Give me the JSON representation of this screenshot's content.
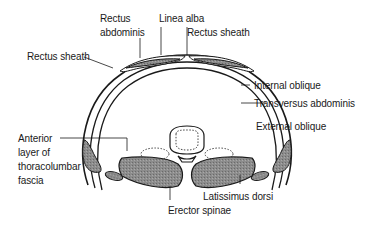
{
  "diagram": {
    "type": "anatomical-cross-section",
    "colors": {
      "line": "#1a1a1a",
      "muscle_fill": "#8a8a8a",
      "rectus_fill": "#9a9a9a",
      "bone_fill": "#ffffff",
      "background": "#ffffff"
    },
    "labels": {
      "rectus_abdominis_1": "Rectus",
      "rectus_abdominis_2": "abdominis",
      "linea_alba": "Linea alba",
      "rectus_sheath_right": "Rectus sheath",
      "rectus_sheath_left": "Rectus sheath",
      "internal_oblique": "Internal oblique",
      "transversus_abdominis": "Transversus abdominis",
      "external_oblique": "External oblique",
      "anterior_layer_1": "Anterior",
      "anterior_layer_2": "layer of",
      "anterior_layer_3": "thoracolumbar",
      "anterior_layer_4": "fascia",
      "latissimus_dorsi": "Latissimus dorsi",
      "erector_spinae": "Erector spinae"
    }
  }
}
